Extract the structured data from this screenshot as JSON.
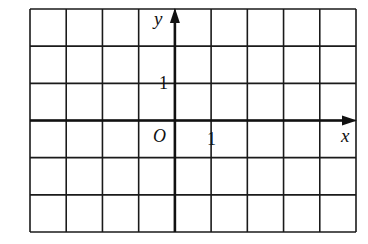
{
  "diagram": {
    "type": "coordinate-grid",
    "grid": {
      "columns": 9,
      "rows": 6,
      "left": 30,
      "top": 9,
      "right": 356,
      "bottom": 232,
      "line_color": "#1a1a1a"
    },
    "origin": {
      "col": 4,
      "row": 3
    },
    "axes": {
      "x": {
        "label": "x",
        "arrow": true
      },
      "y": {
        "label": "y",
        "arrow": true
      },
      "origin_label": "O"
    },
    "ticks": {
      "x_unit_label": "1",
      "y_unit_label": "1"
    }
  }
}
